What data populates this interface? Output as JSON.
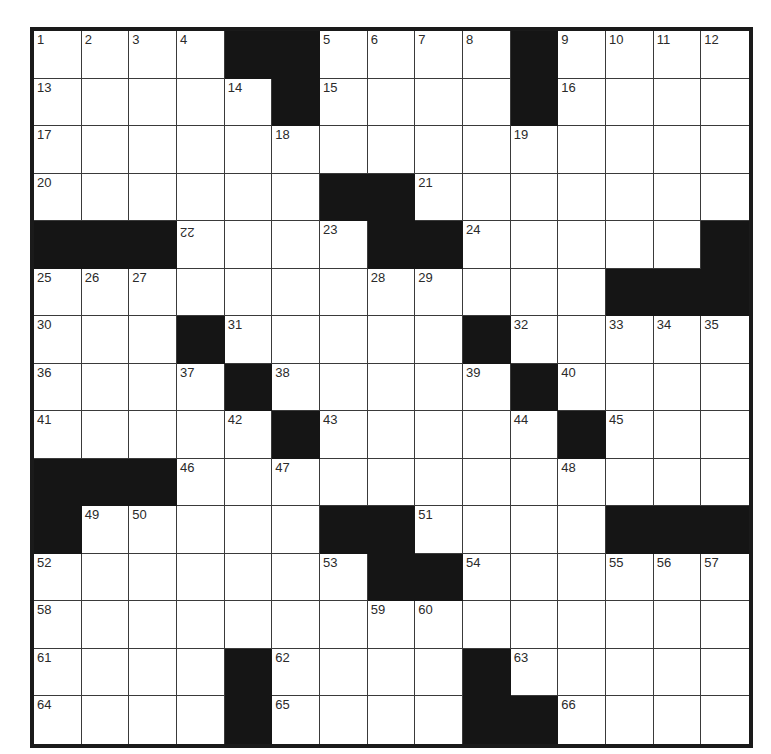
{
  "puzzle": {
    "rows": 15,
    "cols": 15,
    "colors": {
      "block": "#151515",
      "cell": "#ffffff",
      "gridline": "#3a3a3a",
      "border": "#1a1a1a",
      "number": "#2a2a2a"
    },
    "grid": [
      [
        "1",
        "2",
        "3",
        "4",
        "#",
        "#",
        "5",
        "6",
        "7",
        "8",
        "#",
        "9",
        "10",
        "11",
        "12"
      ],
      [
        "13",
        ".",
        ".",
        ".",
        "14",
        "#",
        "15",
        ".",
        ".",
        ".",
        "#",
        "16",
        ".",
        ".",
        "."
      ],
      [
        "17",
        ".",
        ".",
        ".",
        ".",
        "18",
        ".",
        ".",
        ".",
        ".",
        "19",
        ".",
        ".",
        ".",
        "."
      ],
      [
        "20",
        ".",
        ".",
        ".",
        ".",
        ".",
        "#",
        "#",
        "21",
        ".",
        ".",
        ".",
        ".",
        ".",
        "."
      ],
      [
        "#",
        "#",
        "#",
        "22",
        ".",
        ".",
        "23",
        "#",
        "#",
        "24",
        ".",
        ".",
        ".",
        ".",
        "#"
      ],
      [
        "25",
        "26",
        "27",
        ".",
        ".",
        ".",
        ".",
        "28",
        "29",
        ".",
        ".",
        ".",
        "#",
        "#",
        "#"
      ],
      [
        "30",
        ".",
        ".",
        "#",
        "31",
        ".",
        ".",
        ".",
        ".",
        "#",
        "32",
        ".",
        "33",
        "34",
        "35"
      ],
      [
        "36",
        ".",
        ".",
        "37",
        "#",
        "38",
        ".",
        ".",
        ".",
        "39",
        "#",
        "40",
        ".",
        ".",
        "."
      ],
      [
        "41",
        ".",
        ".",
        ".",
        "42",
        "#",
        "43",
        ".",
        ".",
        ".",
        "44",
        "#",
        "45",
        ".",
        "."
      ],
      [
        "#",
        "#",
        "#",
        "46",
        ".",
        "47",
        ".",
        ".",
        ".",
        ".",
        ".",
        "48",
        ".",
        ".",
        "."
      ],
      [
        "#",
        "49",
        "50",
        ".",
        ".",
        ".",
        "#",
        "#",
        "51",
        ".",
        ".",
        ".",
        "#",
        "#",
        "#"
      ],
      [
        "52",
        ".",
        ".",
        ".",
        ".",
        ".",
        "53",
        "#",
        "#",
        "54",
        ".",
        ".",
        "55",
        "56",
        "57"
      ],
      [
        "58",
        ".",
        ".",
        ".",
        ".",
        ".",
        ".",
        "59",
        "60",
        ".",
        ".",
        ".",
        ".",
        ".",
        "."
      ],
      [
        "61",
        ".",
        ".",
        ".",
        "#",
        "62",
        ".",
        ".",
        ".",
        "#",
        "63",
        ".",
        ".",
        ".",
        "."
      ],
      [
        "64",
        ".",
        ".",
        ".",
        "#",
        "65",
        ".",
        ".",
        ".",
        "#",
        "#",
        "66",
        ".",
        ".",
        "."
      ]
    ],
    "flipped_numbers": [
      "22"
    ]
  }
}
